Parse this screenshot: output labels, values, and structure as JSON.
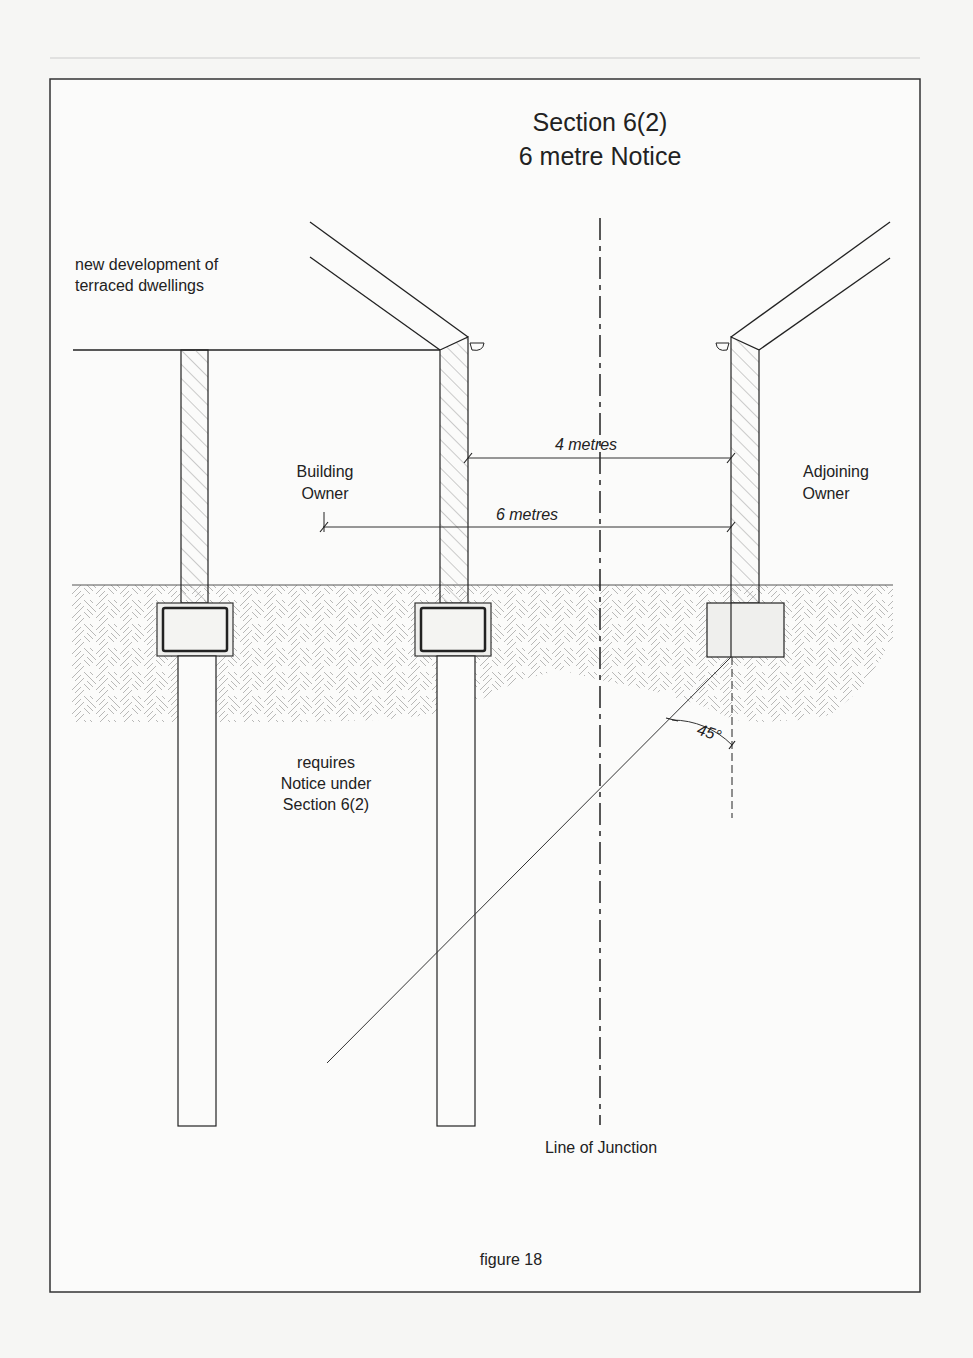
{
  "figure": {
    "title_line1": "Section 6(2)",
    "title_line2": "6 metre Notice",
    "caption": "figure 18"
  },
  "labels": {
    "development_line1": "new development of",
    "development_line2": "terraced dwellings",
    "building_owner_line1": "Building",
    "building_owner_line2": "Owner",
    "adjoining_owner_line1": "Adjoining",
    "adjoining_owner_line2": "Owner",
    "requires_line1": "requires",
    "requires_line2": "Notice under",
    "requires_line3": "Section 6(2)",
    "line_of_junction": "Line of Junction"
  },
  "dimensions": {
    "inner": "4 metres",
    "outer": "6 metres",
    "angle": "45°"
  },
  "colors": {
    "line": "#222222",
    "hatch": "#9a9a9a",
    "paper": "#f6f6f4"
  }
}
